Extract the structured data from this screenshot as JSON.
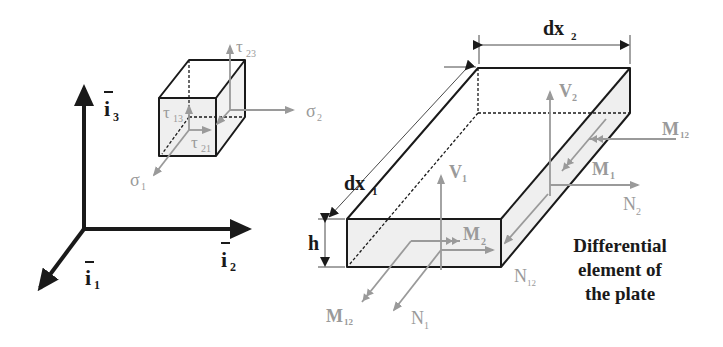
{
  "figure": {
    "title": "Differential element of the plate",
    "caption_lines": [
      "Differential",
      "element of",
      "the plate"
    ]
  },
  "colors": {
    "structure": "#1a1a1a",
    "force_arrows": "#9a9a9a",
    "face_fill": "#efefef",
    "background": "#ffffff"
  },
  "axes": {
    "i1": {
      "label": "i",
      "subscript": "1",
      "overbar": true
    },
    "i2": {
      "label": "i",
      "subscript": "2",
      "overbar": true
    },
    "i3": {
      "label": "i",
      "subscript": "3",
      "overbar": true
    }
  },
  "stress_cube": {
    "labels": {
      "tau23": {
        "sym": "τ",
        "sub": "23"
      },
      "tau13": {
        "sym": "τ",
        "sub": "13"
      },
      "tau21": {
        "sym": "τ",
        "sub": "21"
      },
      "sigma1": {
        "sym": "σ",
        "sub": "1"
      },
      "sigma2": {
        "sym": "σ",
        "sub": "2"
      }
    }
  },
  "plate": {
    "dimensions": {
      "dx1": {
        "sym": "dx",
        "sub": "1"
      },
      "dx2": {
        "sym": "dx",
        "sub": "2"
      },
      "h": {
        "sym": "h"
      }
    },
    "resultants": {
      "V1": {
        "sym": "V",
        "sub": "1"
      },
      "V2": {
        "sym": "V",
        "sub": "2"
      },
      "M1": {
        "sym": "M",
        "sub": "1"
      },
      "M2": {
        "sym": "M",
        "sub": "2"
      },
      "M12_right": {
        "sym": "M",
        "sub": "12"
      },
      "M12_front": {
        "sym": "M",
        "sub": "12"
      },
      "N1": {
        "sym": "N",
        "sub": "1"
      },
      "N2": {
        "sym": "N",
        "sub": "2"
      },
      "N12": {
        "sym": "N",
        "sub": "12"
      }
    }
  }
}
